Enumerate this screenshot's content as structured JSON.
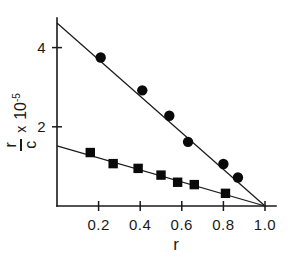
{
  "chart_data": {
    "type": "scatter",
    "title": "",
    "subtitle": "",
    "xlabel": "r",
    "ylabel": "r/c x 10^-5",
    "ylabel_parts": {
      "numerator": "r",
      "denominator": "c",
      "times": "x",
      "base": "10",
      "exponent": "-5"
    },
    "xlim": [
      0,
      1.06
    ],
    "ylim": [
      0,
      5.1
    ],
    "xticks": [
      0.2,
      0.4,
      0.6,
      0.8,
      1.0
    ],
    "xticklabels": [
      "0.2",
      "0.4",
      "0.6",
      "0.8",
      "1.0"
    ],
    "yticks": [
      2,
      4
    ],
    "yticklabels": [
      "2",
      "4"
    ],
    "grid": false,
    "legend": "none",
    "series": [
      {
        "name": "upper-series",
        "marker": "circle",
        "color": "#0a0a0a",
        "x": [
          0.21,
          0.41,
          0.54,
          0.63,
          0.8,
          0.87
        ],
        "y": [
          3.75,
          2.92,
          2.28,
          1.62,
          1.06,
          0.72
        ],
        "fit_line": {
          "x": [
            0.0,
            1.0
          ],
          "y": [
            4.62,
            0.0
          ]
        }
      },
      {
        "name": "lower-series",
        "marker": "square",
        "color": "#0a0a0a",
        "x": [
          0.16,
          0.27,
          0.39,
          0.5,
          0.58,
          0.66,
          0.81
        ],
        "y": [
          1.35,
          1.07,
          0.95,
          0.78,
          0.6,
          0.54,
          0.32
        ],
        "fit_line": {
          "x": [
            0.0,
            1.0
          ],
          "y": [
            1.52,
            0.0
          ]
        }
      }
    ]
  },
  "axes": {
    "x_axis_name": "r",
    "y_axis_name": "r/c"
  }
}
